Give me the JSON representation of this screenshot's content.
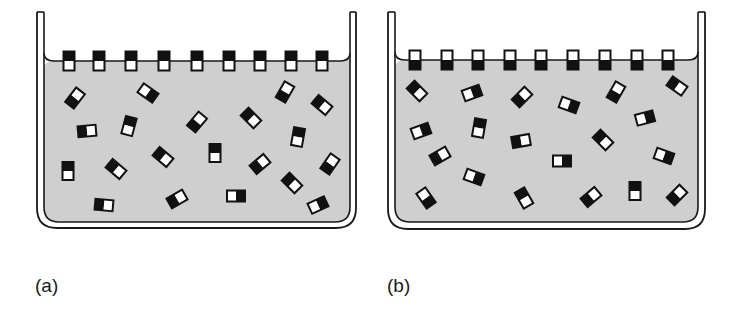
{
  "figure": {
    "colors": {
      "liquid": "#cfcfcf",
      "line": "#1a1a1a",
      "black_end": "#111111",
      "white_end": "#ffffff",
      "background": "#ffffff"
    },
    "panels": [
      {
        "id": "a",
        "label": "(a)",
        "label_pos": [
          35,
          275
        ],
        "description": "Surface molecules oriented with black end upward (out of liquid), white end in liquid",
        "outer": {
          "left": 37,
          "right": 356,
          "top": 12,
          "bottom": 228,
          "radius": 20
        },
        "inner": {
          "left": 44,
          "right": 350,
          "bottom": 222,
          "radius": 15
        },
        "surface_y": 61,
        "surface_orientation": "black-up",
        "surface_molecules_x": [
          69,
          99,
          131,
          164,
          197,
          229,
          260,
          291,
          322
        ],
        "bulk_molecules": [
          {
            "x": 75,
            "y": 98,
            "angle": -52,
            "white": "end"
          },
          {
            "x": 148,
            "y": 93,
            "angle": 35,
            "white": "start"
          },
          {
            "x": 87,
            "y": 131,
            "angle": -5,
            "white": "end"
          },
          {
            "x": 129,
            "y": 126,
            "angle": -75,
            "white": "start"
          },
          {
            "x": 197,
            "y": 122,
            "angle": -50,
            "white": "end"
          },
          {
            "x": 251,
            "y": 118,
            "angle": 45,
            "white": "end"
          },
          {
            "x": 285,
            "y": 92,
            "angle": -60,
            "white": "end"
          },
          {
            "x": 322,
            "y": 105,
            "angle": 40,
            "white": "end"
          },
          {
            "x": 68,
            "y": 171,
            "angle": 90,
            "white": "end"
          },
          {
            "x": 116,
            "y": 169,
            "angle": 40,
            "white": "end"
          },
          {
            "x": 163,
            "y": 157,
            "angle": 40,
            "white": "end"
          },
          {
            "x": 215,
            "y": 153,
            "angle": -90,
            "white": "start"
          },
          {
            "x": 260,
            "y": 164,
            "angle": -40,
            "white": "end"
          },
          {
            "x": 298,
            "y": 137,
            "angle": -80,
            "white": "start"
          },
          {
            "x": 330,
            "y": 164,
            "angle": -55,
            "white": "end"
          },
          {
            "x": 104,
            "y": 205,
            "angle": 5,
            "white": "end"
          },
          {
            "x": 177,
            "y": 199,
            "angle": -30,
            "white": "end"
          },
          {
            "x": 236,
            "y": 196,
            "angle": 0,
            "white": "start"
          },
          {
            "x": 292,
            "y": 183,
            "angle": 45,
            "white": "end"
          },
          {
            "x": 318,
            "y": 205,
            "angle": -25,
            "white": "start"
          }
        ]
      },
      {
        "id": "b",
        "label": "(b)",
        "label_pos": [
          387,
          275
        ],
        "description": "Surface molecules oriented with white end upward (out of liquid), black end in liquid",
        "outer": {
          "left": 388,
          "right": 705,
          "top": 12,
          "bottom": 229,
          "radius": 20
        },
        "inner": {
          "left": 395,
          "right": 698,
          "bottom": 222,
          "radius": 15
        },
        "surface_y": 60,
        "surface_orientation": "white-up",
        "surface_molecules_x": [
          415,
          447,
          478,
          510,
          541,
          573,
          605,
          637,
          668
        ],
        "bulk_molecules": [
          {
            "x": 417,
            "y": 91,
            "angle": 45,
            "white": "end"
          },
          {
            "x": 472,
            "y": 93,
            "angle": -20,
            "white": "start"
          },
          {
            "x": 522,
            "y": 97,
            "angle": -45,
            "white": "end"
          },
          {
            "x": 569,
            "y": 105,
            "angle": 20,
            "white": "start"
          },
          {
            "x": 616,
            "y": 92,
            "angle": -60,
            "white": "end"
          },
          {
            "x": 677,
            "y": 86,
            "angle": 35,
            "white": "end"
          },
          {
            "x": 421,
            "y": 131,
            "angle": -20,
            "white": "start"
          },
          {
            "x": 479,
            "y": 128,
            "angle": -80,
            "white": "start"
          },
          {
            "x": 440,
            "y": 156,
            "angle": -30,
            "white": "end"
          },
          {
            "x": 521,
            "y": 141,
            "angle": -10,
            "white": "end"
          },
          {
            "x": 562,
            "y": 161,
            "angle": 0,
            "white": "start"
          },
          {
            "x": 603,
            "y": 140,
            "angle": 45,
            "white": "end"
          },
          {
            "x": 645,
            "y": 118,
            "angle": -15,
            "white": "start"
          },
          {
            "x": 664,
            "y": 156,
            "angle": 20,
            "white": "start"
          },
          {
            "x": 426,
            "y": 198,
            "angle": 55,
            "white": "start"
          },
          {
            "x": 474,
            "y": 177,
            "angle": 20,
            "white": "start"
          },
          {
            "x": 524,
            "y": 198,
            "angle": 60,
            "white": "end"
          },
          {
            "x": 591,
            "y": 197,
            "angle": -40,
            "white": "end"
          },
          {
            "x": 635,
            "y": 191,
            "angle": -90,
            "white": "start"
          },
          {
            "x": 677,
            "y": 195,
            "angle": -45,
            "white": "end"
          }
        ]
      }
    ]
  }
}
